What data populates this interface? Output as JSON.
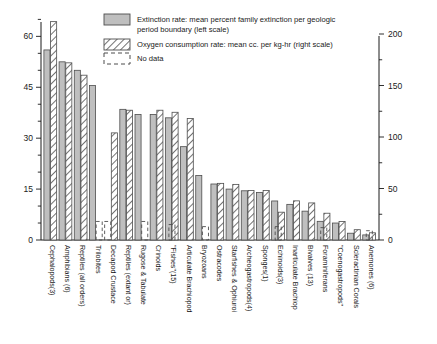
{
  "chart_data": {
    "type": "bar",
    "title": "",
    "xlabel": "",
    "ylabel": "",
    "grid": false,
    "legend_position": "top-center",
    "y_left": {
      "label": "Extinction rate (mean percent family extinction per geologic period boundary)",
      "ticks": [
        0,
        15,
        30,
        45,
        60
      ],
      "minor_tick_step": 5,
      "ylim": [
        0,
        66
      ]
    },
    "y_right": {
      "label": "Oxygen consumption rate (mean cc. per kg-hr)",
      "ticks": [
        0,
        50,
        100,
        150,
        200
      ],
      "minor_tick_step": 25,
      "ylim": [
        0,
        200
      ]
    },
    "legend": [
      {
        "key": "extinction",
        "swatch": "solid-gray",
        "label": "Extinction rate: mean percent family extinction per geologic period boundary (left scale)"
      },
      {
        "key": "oxygen",
        "swatch": "hatched",
        "label": "Oxygen consumption rate: mean cc. per kg-hr (right scale)"
      },
      {
        "key": "nodata",
        "swatch": "dashed-outline",
        "label": "No data"
      }
    ],
    "categories": [
      "Cephalopods(3)",
      "Amphibians (6)",
      "Reptiles (all orders)",
      "Trilobites",
      "Decapod Crustace",
      "Reptiles (extant or)",
      "Rugose & Tabulate",
      "Crinoids",
      "\"Fishes\"(15)",
      "Articulate Brachiopod",
      "Bryozoans",
      "Ostracodes",
      "Starfishes & Ophiuroi",
      "Archeogastropods(4)",
      "Sponges(1)",
      "Echinoids(3)",
      "Inarticulate Brachiop",
      "Bivalves (13)",
      "Foraminiferans",
      "\"Coenogastropods\"",
      "Scleractinian Corals",
      "Anemones (6)"
    ],
    "series": [
      {
        "name": "Extinction rate: mean percent family extinction per geologic period boundary (left scale)",
        "scale": "left",
        "style": "solid-gray",
        "values": [
          56.0,
          52.5,
          50.0,
          45.5,
          null,
          38.5,
          37.0,
          37.0,
          36.0,
          27.5,
          19.0,
          16.5,
          15.0,
          14.5,
          14.0,
          11.5,
          10.5,
          8.5,
          5.5,
          5.0,
          2.0,
          1.5
        ]
      },
      {
        "name": "Oxygen consumption rate: mean cc. per kg-hr (right scale)",
        "scale": "right",
        "style": "hatched",
        "values": [
          212,
          172,
          160,
          null,
          104,
          126,
          104,
          126,
          124,
          118,
          null,
          55,
          54,
          48,
          48,
          27,
          38,
          36,
          26,
          18,
          10,
          7
        ]
      },
      {
        "name": "No data",
        "style": "dashed-outline",
        "values": [
          null,
          null,
          null,
          18,
          18,
          null,
          18,
          null,
          15,
          null,
          13,
          null,
          null,
          null,
          null,
          13,
          null,
          null,
          12,
          null,
          null,
          9
        ],
        "note": "Dashed open boxes mark categories where a measurement is unavailable"
      }
    ],
    "bars": [
      {
        "category": "Cephalopods(3)",
        "extinction": 56.0,
        "oxygen": 212,
        "nodata": null
      },
      {
        "category": "Amphibians (6)",
        "extinction": 52.5,
        "oxygen": 172,
        "nodata": null
      },
      {
        "category": "Reptiles (all orders)",
        "extinction": 50.0,
        "oxygen": 160,
        "nodata": null
      },
      {
        "category": "Trilobites",
        "extinction": 45.5,
        "oxygen": null,
        "nodata": 18
      },
      {
        "category": "Decapod Crustace",
        "extinction": null,
        "oxygen": 104,
        "nodata": 18
      },
      {
        "category": "Reptiles (extant or)",
        "extinction": 38.5,
        "oxygen": 126,
        "nodata": null
      },
      {
        "category": "Rugose & Tabulate",
        "extinction": 37.0,
        "oxygen": null,
        "nodata": 18
      },
      {
        "category": "Crinoids",
        "extinction": 37.0,
        "oxygen": 126,
        "nodata": null
      },
      {
        "category": "\"Fishes\"(15)",
        "extinction": 36.0,
        "oxygen": 124,
        "nodata": 15
      },
      {
        "category": "Articulate Brachiopod",
        "extinction": 27.5,
        "oxygen": 118,
        "nodata": null
      },
      {
        "category": "Bryozoans",
        "extinction": 19.0,
        "oxygen": null,
        "nodata": 13
      },
      {
        "category": "Ostracodes",
        "extinction": 16.5,
        "oxygen": 55,
        "nodata": null
      },
      {
        "category": "Starfishes & Ophiuroi",
        "extinction": 15.0,
        "oxygen": 54,
        "nodata": null
      },
      {
        "category": "Archeogastropods(4)",
        "extinction": 14.5,
        "oxygen": 48,
        "nodata": null
      },
      {
        "category": "Sponges(1)",
        "extinction": 14.0,
        "oxygen": 48,
        "nodata": null
      },
      {
        "category": "Echinoids(3)",
        "extinction": 11.5,
        "oxygen": 27,
        "nodata": 13
      },
      {
        "category": "Inarticulate Brachiop",
        "extinction": 10.5,
        "oxygen": 38,
        "nodata": null
      },
      {
        "category": "Bivalves (13)",
        "extinction": 8.5,
        "oxygen": 36,
        "nodata": null
      },
      {
        "category": "Foraminiferans",
        "extinction": 5.5,
        "oxygen": 26,
        "nodata": 12
      },
      {
        "category": "\"Coenogastropods\"",
        "extinction": 5.0,
        "oxygen": 18,
        "nodata": null
      },
      {
        "category": "Scleractinian Corals",
        "extinction": 2.0,
        "oxygen": 10,
        "nodata": null
      },
      {
        "category": "Anemones (6)",
        "extinction": 1.5,
        "oxygen": 7,
        "nodata": 9
      }
    ],
    "colors": {
      "bar_fill": "#bfbfbf",
      "bar_stroke": "#4d4d4d",
      "hatch_stroke": "#4d4d4d",
      "axis": "#1a1a1a",
      "background": "#ffffff"
    }
  }
}
